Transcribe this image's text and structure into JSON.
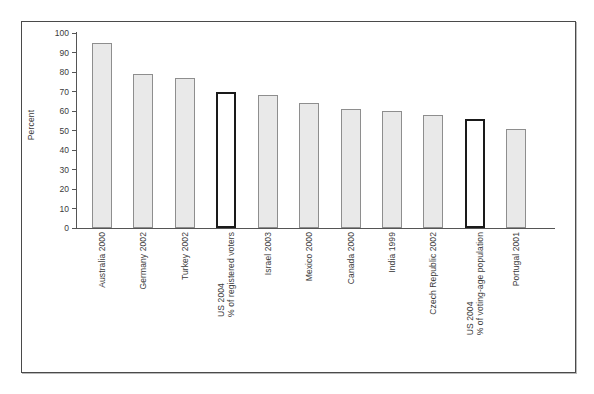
{
  "chart_data": {
    "type": "bar",
    "title": "",
    "xlabel": "",
    "ylabel": "Percent",
    "ylim": [
      0,
      100
    ],
    "ytick_values": [
      100,
      90,
      80,
      70,
      60,
      50,
      40,
      30,
      20,
      10,
      0
    ],
    "grid": false,
    "legend": "none",
    "categories": [
      "Australia 2000",
      "Germany 2002",
      "Turkey 2002",
      "US 2004",
      "Israel 2003",
      "Mexico 2000",
      "Canada 2000",
      "India 1999",
      "Czech Republic 2002",
      "US 2004",
      "Portugal 2001"
    ],
    "values": [
      95,
      79,
      77,
      70,
      68,
      64,
      61,
      60,
      58,
      56,
      51
    ],
    "bars": [
      {
        "label_line1": "Australia 2000",
        "label_line2": "",
        "value": 95,
        "highlight": false
      },
      {
        "label_line1": "Germany 2002",
        "label_line2": "",
        "value": 79,
        "highlight": false
      },
      {
        "label_line1": "Turkey 2002",
        "label_line2": "",
        "value": 77,
        "highlight": false
      },
      {
        "label_line1": "US 2004",
        "label_line2": "% of registered voters",
        "value": 70,
        "highlight": true
      },
      {
        "label_line1": "Israel 2003",
        "label_line2": "",
        "value": 68,
        "highlight": false
      },
      {
        "label_line1": "Mexico 2000",
        "label_line2": "",
        "value": 64,
        "highlight": false
      },
      {
        "label_line1": "Canada 2000",
        "label_line2": "",
        "value": 61,
        "highlight": false
      },
      {
        "label_line1": "India 1999",
        "label_line2": "",
        "value": 60,
        "highlight": false
      },
      {
        "label_line1": "Czech Republic 2002",
        "label_line2": "",
        "value": 58,
        "highlight": false
      },
      {
        "label_line1": "US 2004",
        "label_line2": "% of voting-age population",
        "value": 56,
        "highlight": true
      },
      {
        "label_line1": "Portugal 2001",
        "label_line2": "",
        "value": 51,
        "highlight": false
      }
    ],
    "colors": {
      "bar_fill": "#e9e9e9",
      "bar_border": "#8e8e8e",
      "highlight_fill": "#ffffff",
      "highlight_border": "#1a1a1a",
      "axis": "#555555",
      "text": "#3b3b3b",
      "frame": "#4a4a4a",
      "background": "#ffffff"
    }
  }
}
